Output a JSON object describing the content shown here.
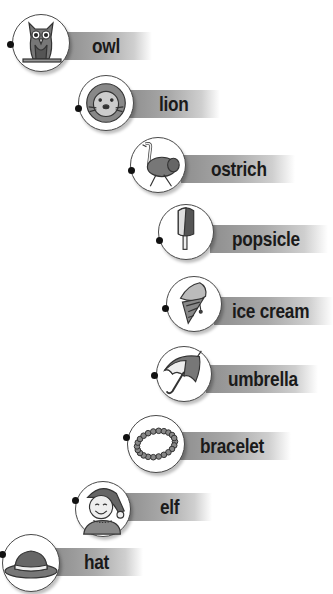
{
  "items": [
    {
      "word": "owl",
      "icon": "owl-icon",
      "circle": [
        40,
        42,
        28
      ],
      "dot": [
        10,
        44
      ],
      "bar": [
        62,
        32,
        90
      ],
      "text_x": 92
    },
    {
      "word": "lion",
      "icon": "lion-icon",
      "circle": [
        105,
        102,
        27
      ],
      "dot": [
        78,
        108
      ],
      "bar": [
        128,
        90,
        92
      ],
      "text_x": 159
    },
    {
      "word": "ostrich",
      "icon": "ostrich-icon",
      "circle": [
        157,
        164,
        27
      ],
      "dot": [
        131,
        170
      ],
      "bar": [
        181,
        155,
        114
      ],
      "text_x": 211
    },
    {
      "word": "popsicle",
      "icon": "popsicle-icon",
      "circle": [
        185,
        231,
        27
      ],
      "dot": [
        159,
        240
      ],
      "bar": [
        210,
        225,
        118
      ],
      "text_x": 232
    },
    {
      "word": "ice cream",
      "icon": "ice-cream-icon",
      "circle": [
        193,
        303,
        27
      ],
      "dot": [
        165,
        308
      ],
      "bar": [
        214,
        297,
        119
      ],
      "text_x": 232
    },
    {
      "word": "umbrella",
      "icon": "umbrella-icon",
      "circle": [
        183,
        373,
        27
      ],
      "dot": [
        154,
        375
      ],
      "bar": [
        206,
        365,
        112
      ],
      "text_x": 228
    },
    {
      "word": "bracelet",
      "icon": "bracelet-icon",
      "circle": [
        155,
        443,
        28
      ],
      "dot": [
        126,
        437
      ],
      "bar": [
        179,
        432,
        112
      ],
      "text_x": 200
    },
    {
      "word": "elf",
      "icon": "elf-icon",
      "circle": [
        102,
        508,
        27
      ],
      "dot": [
        75,
        500
      ],
      "bar": [
        124,
        493,
        88
      ],
      "text_x": 160
    },
    {
      "word": "hat",
      "icon": "hat-icon",
      "circle": [
        30,
        562,
        28
      ],
      "dot": [
        2,
        554
      ],
      "bar": [
        55,
        548,
        88
      ],
      "text_x": 84
    }
  ]
}
